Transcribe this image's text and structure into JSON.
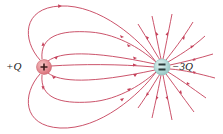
{
  "diagram": {
    "line_color": "#c5415a",
    "charges": [
      {
        "id": "positive",
        "label": "+Q",
        "symbol": "+",
        "cx": 44,
        "cy": 67,
        "r": 7.5,
        "fill": "#e8888f",
        "stroke": "#c96a72"
      },
      {
        "id": "negative",
        "label": "−3Q",
        "symbol": "=",
        "cx": 162,
        "cy": 67,
        "r": 8,
        "fill": "#b9dedd",
        "stroke": "#8fbdbb"
      }
    ],
    "labels": {
      "positive": "+Q",
      "negative": "−3Q"
    }
  }
}
